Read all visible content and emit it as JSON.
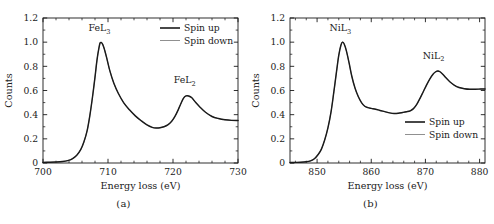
{
  "figure": {
    "type": "scientific-figure",
    "panel_count": 2,
    "background_color": "#ffffff",
    "line_color": "#1a1a1a"
  },
  "panels": [
    {
      "id": "a",
      "caption": "(a)",
      "element": "Fe",
      "chart_data": {
        "type": "line",
        "title": "",
        "xlabel": "Energy loss (eV)",
        "ylabel": "Counts",
        "xlim": [
          700,
          730
        ],
        "ylim": [
          0,
          1.2
        ],
        "xticks": [
          700,
          710,
          720,
          730
        ],
        "xticklabels": [
          "700",
          "710",
          "720",
          "730"
        ],
        "yticks": [
          0,
          0.2,
          0.4,
          0.6,
          0.8,
          1.0,
          1.2
        ],
        "yticklabels": [
          "0",
          "0.2",
          "0.4",
          "0.6",
          "0.8",
          "1.0",
          "1.2"
        ],
        "minor_ticks": true,
        "grid": false,
        "legend_position": "top-right",
        "annotations": [
          {
            "text": "FeL3",
            "label_main": "FeL",
            "label_sub": "3",
            "x": 708.7,
            "y": 1.09
          },
          {
            "text": "FeL2",
            "label_main": "FeL",
            "label_sub": "2",
            "x": 721.8,
            "y": 0.66
          }
        ],
        "series": [
          {
            "name": "Spin up",
            "line_width": 1.45,
            "color": "#1a1a1a",
            "x": [
              700.0,
              701.0,
              702.0,
              703.0,
              703.8,
              704.5,
              705.2,
              705.8,
              706.3,
              706.8,
              707.2,
              707.6,
              708.0,
              708.3,
              708.6,
              708.8,
              709.1,
              709.4,
              709.8,
              710.3,
              710.9,
              711.6,
              712.4,
              713.3,
              714.2,
              715.1,
              716.0,
              716.8,
              717.4,
              718.0,
              718.6,
              719.2,
              719.8,
              720.3,
              720.8,
              721.2,
              721.6,
              722.0,
              722.4,
              722.9,
              723.5,
              724.2,
              725.0,
              726.0,
              727.0,
              728.0,
              729.0,
              730.0
            ],
            "y": [
              0.005,
              0.006,
              0.008,
              0.012,
              0.02,
              0.035,
              0.065,
              0.11,
              0.175,
              0.27,
              0.39,
              0.54,
              0.71,
              0.85,
              0.95,
              0.995,
              0.99,
              0.95,
              0.87,
              0.76,
              0.66,
              0.575,
              0.5,
              0.44,
              0.39,
              0.35,
              0.315,
              0.295,
              0.29,
              0.292,
              0.3,
              0.315,
              0.345,
              0.385,
              0.44,
              0.49,
              0.535,
              0.555,
              0.555,
              0.54,
              0.5,
              0.46,
              0.42,
              0.385,
              0.368,
              0.358,
              0.353,
              0.352
            ]
          },
          {
            "name": "Spin down",
            "line_width": 0.7,
            "color": "#6b6b6b",
            "x": [
              700.0,
              701.0,
              702.0,
              703.0,
              703.8,
              704.5,
              705.2,
              705.8,
              706.3,
              706.8,
              707.2,
              707.6,
              708.0,
              708.3,
              708.6,
              708.8,
              709.1,
              709.4,
              709.8,
              710.3,
              710.9,
              711.6,
              712.4,
              713.3,
              714.2,
              715.1,
              716.0,
              716.8,
              717.4,
              718.0,
              718.6,
              719.2,
              719.8,
              720.3,
              720.8,
              721.2,
              721.6,
              722.0,
              722.4,
              722.9,
              723.5,
              724.2,
              725.0,
              726.0,
              727.0,
              728.0,
              729.0,
              730.0
            ],
            "y": [
              0.005,
              0.006,
              0.008,
              0.012,
              0.02,
              0.035,
              0.065,
              0.11,
              0.175,
              0.27,
              0.39,
              0.54,
              0.71,
              0.85,
              0.95,
              0.995,
              0.99,
              0.95,
              0.87,
              0.76,
              0.66,
              0.575,
              0.5,
              0.44,
              0.39,
              0.35,
              0.315,
              0.295,
              0.29,
              0.292,
              0.3,
              0.315,
              0.345,
              0.385,
              0.44,
              0.49,
              0.535,
              0.555,
              0.555,
              0.54,
              0.5,
              0.46,
              0.42,
              0.385,
              0.368,
              0.358,
              0.353,
              0.352
            ]
          }
        ]
      },
      "legend": {
        "items": [
          {
            "label": "Spin up",
            "style": "thick"
          },
          {
            "label": "Spin down",
            "style": "thin"
          }
        ]
      }
    },
    {
      "id": "b",
      "caption": "(b)",
      "element": "Ni",
      "chart_data": {
        "type": "line",
        "title": "",
        "xlabel": "Energy loss (eV)",
        "ylabel": "Counts",
        "xlim": [
          845,
          881
        ],
        "ylim": [
          0,
          1.2
        ],
        "xticks": [
          850,
          860,
          870,
          880
        ],
        "xticklabels": [
          "850",
          "860",
          "870",
          "880"
        ],
        "yticks": [
          0,
          0.2,
          0.4,
          0.6,
          0.8,
          1.0,
          1.2
        ],
        "yticklabels": [
          "0",
          "0.2",
          "0.4",
          "0.6",
          "0.8",
          "1.0",
          "1.2"
        ],
        "minor_ticks": true,
        "grid": false,
        "legend_position": "bottom-right",
        "annotations": [
          {
            "text": "NiL3",
            "label_main": "NiL",
            "label_sub": "3",
            "x": 854.3,
            "y": 1.09
          },
          {
            "text": "NiL2",
            "label_main": "NiL",
            "label_sub": "2",
            "x": 871.5,
            "y": 0.86
          }
        ],
        "series": [
          {
            "name": "Spin up",
            "line_width": 1.45,
            "color": "#1a1a1a",
            "x": [
              845.0,
              846.0,
              847.0,
              848.0,
              848.8,
              849.5,
              850.2,
              850.8,
              851.4,
              852.0,
              852.6,
              853.1,
              853.6,
              854.0,
              854.4,
              854.7,
              855.0,
              855.4,
              855.9,
              856.4,
              857.0,
              857.6,
              858.2,
              858.8,
              859.4,
              860.0,
              860.8,
              861.6,
              862.5,
              863.4,
              864.2,
              865.0,
              865.8,
              866.5,
              867.2,
              867.8,
              868.4,
              869.0,
              869.6,
              870.2,
              870.8,
              871.4,
              871.9,
              872.3,
              872.7,
              873.2,
              873.8,
              874.5,
              875.3,
              876.2,
              877.2,
              878.2,
              879.2,
              880.2,
              881.0
            ],
            "y": [
              0.004,
              0.005,
              0.006,
              0.01,
              0.018,
              0.035,
              0.07,
              0.115,
              0.19,
              0.29,
              0.43,
              0.59,
              0.76,
              0.89,
              0.975,
              1.0,
              0.985,
              0.93,
              0.83,
              0.72,
              0.62,
              0.55,
              0.5,
              0.47,
              0.458,
              0.452,
              0.445,
              0.435,
              0.425,
              0.415,
              0.41,
              0.412,
              0.418,
              0.424,
              0.432,
              0.45,
              0.485,
              0.535,
              0.59,
              0.645,
              0.695,
              0.735,
              0.755,
              0.762,
              0.755,
              0.735,
              0.705,
              0.672,
              0.645,
              0.625,
              0.615,
              0.61,
              0.61,
              0.612,
              0.613
            ]
          },
          {
            "name": "Spin down",
            "line_width": 0.7,
            "color": "#6b6b6b",
            "x": [
              845.0,
              846.0,
              847.0,
              848.0,
              848.8,
              849.5,
              850.2,
              850.8,
              851.4,
              852.0,
              852.6,
              853.1,
              853.6,
              854.0,
              854.4,
              854.7,
              855.0,
              855.4,
              855.9,
              856.4,
              857.0,
              857.6,
              858.2,
              858.8,
              859.4,
              860.0,
              860.8,
              861.6,
              862.5,
              863.4,
              864.2,
              865.0,
              865.8,
              866.5,
              867.2,
              867.8,
              868.4,
              869.0,
              869.6,
              870.2,
              870.8,
              871.4,
              871.9,
              872.3,
              872.7,
              873.2,
              873.8,
              874.5,
              875.3,
              876.2,
              877.2,
              878.2,
              879.2,
              880.2,
              881.0
            ],
            "y": [
              0.004,
              0.005,
              0.006,
              0.01,
              0.018,
              0.035,
              0.07,
              0.115,
              0.19,
              0.29,
              0.43,
              0.59,
              0.76,
              0.89,
              0.975,
              1.0,
              0.985,
              0.93,
              0.83,
              0.72,
              0.62,
              0.55,
              0.5,
              0.47,
              0.458,
              0.452,
              0.445,
              0.435,
              0.425,
              0.415,
              0.41,
              0.412,
              0.418,
              0.424,
              0.432,
              0.45,
              0.485,
              0.535,
              0.59,
              0.645,
              0.695,
              0.735,
              0.755,
              0.762,
              0.755,
              0.735,
              0.705,
              0.672,
              0.645,
              0.625,
              0.615,
              0.61,
              0.61,
              0.612,
              0.613
            ]
          }
        ]
      },
      "legend": {
        "items": [
          {
            "label": "Spin up",
            "style": "thick"
          },
          {
            "label": "Spin down",
            "style": "thin"
          }
        ]
      }
    }
  ]
}
